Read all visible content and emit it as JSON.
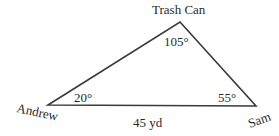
{
  "diagram": {
    "type": "triangle",
    "vertices": {
      "top": {
        "label": "Trash Can",
        "angle": "105°"
      },
      "left": {
        "label": "Andrew",
        "angle": "20°"
      },
      "right": {
        "label": "Sam",
        "angle": "55°"
      }
    },
    "base_side": {
      "label": "45 yd"
    },
    "line_color": "#3a3a3a"
  }
}
